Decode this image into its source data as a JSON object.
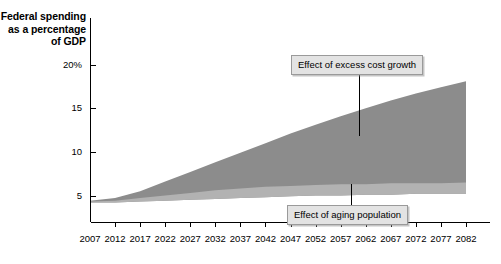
{
  "chart_data": {
    "type": "area",
    "title": "",
    "ylabel_lines": [
      "Federal spending",
      "as a percentage",
      "of GDP"
    ],
    "xlabel": "",
    "ylim": [
      0,
      21.5
    ],
    "xlim": [
      2007,
      2082
    ],
    "grid": false,
    "legend_position": "none",
    "ytick_labels": [
      "20%",
      "15",
      "10",
      "5"
    ],
    "ytick_values": [
      20,
      15,
      10,
      5
    ],
    "xtick_labels": [
      "2007",
      "2012",
      "2017",
      "2022",
      "2027",
      "2032",
      "2037",
      "2042",
      "2047",
      "2052",
      "2057",
      "2062",
      "2067",
      "2072",
      "2077",
      "2082"
    ],
    "xtick_values": [
      2007,
      2012,
      2017,
      2022,
      2027,
      2032,
      2037,
      2042,
      2047,
      2052,
      2057,
      2062,
      2067,
      2072,
      2077,
      2082
    ],
    "x": [
      2007,
      2012,
      2017,
      2022,
      2027,
      2032,
      2037,
      2042,
      2047,
      2052,
      2057,
      2062,
      2067,
      2072,
      2077,
      2082
    ],
    "series": [
      {
        "name": "Baseline spending",
        "color": "#ffffff",
        "values": [
          4.2,
          4.2,
          4.3,
          4.4,
          4.5,
          4.6,
          4.7,
          4.8,
          4.9,
          5.0,
          5.0,
          5.1,
          5.1,
          5.2,
          5.2,
          5.2
        ]
      },
      {
        "name": "Effect of aging population",
        "color": "#b2b2b2",
        "values": [
          4.3,
          4.4,
          4.7,
          5.0,
          5.3,
          5.6,
          5.8,
          6.0,
          6.1,
          6.2,
          6.3,
          6.3,
          6.4,
          6.4,
          6.4,
          6.5
        ]
      },
      {
        "name": "Effect of excess cost growth",
        "color": "#8c8c8c",
        "values": [
          4.4,
          4.7,
          5.5,
          6.6,
          7.7,
          8.8,
          9.9,
          11.0,
          12.1,
          13.1,
          14.1,
          15.0,
          15.9,
          16.7,
          17.4,
          18.1
        ]
      }
    ],
    "annotations": [
      {
        "id": "excess-cost-growth",
        "label": "Effect of excess cost growth",
        "box_x": 291,
        "box_y": 55,
        "leader_x": 359,
        "leader_y_start": 74,
        "leader_y_end": 136
      },
      {
        "id": "aging-population",
        "label": "Effect of aging population",
        "box_x": 287,
        "box_y": 205,
        "leader_x": 351,
        "leader_y_start": 205,
        "leader_y_end": 184
      }
    ]
  },
  "axis_title": {
    "line1": "Federal spending",
    "line2": "as a percentage",
    "line3": "of GDP"
  },
  "colors": {
    "dark_band": "#8c8c8c",
    "light_band": "#b2b2b2",
    "axis": "#000000",
    "callout_bg": "#e3e3e3",
    "callout_border": "#9a9a9a"
  }
}
